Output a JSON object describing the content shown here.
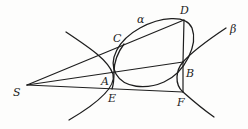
{
  "figure": {
    "type": "geometry-diagram",
    "curves": [
      {
        "id": "alpha",
        "label": "α",
        "kind": "ellipse"
      },
      {
        "id": "beta",
        "label": "β",
        "kind": "hyperbola"
      }
    ],
    "points": {
      "S": {
        "label": "S",
        "x": 27,
        "y": 85
      },
      "A": {
        "label": "A",
        "x": 114,
        "y": 71
      },
      "B": {
        "label": "B",
        "x": 183,
        "y": 62
      },
      "C": {
        "label": "C",
        "x": 123,
        "y": 44
      },
      "D": {
        "label": "D",
        "x": 184,
        "y": 20
      },
      "E": {
        "label": "E",
        "x": 112,
        "y": 89
      },
      "F": {
        "label": "F",
        "x": 183,
        "y": 92
      }
    },
    "segments": [
      [
        "S",
        "D"
      ],
      [
        "S",
        "B"
      ],
      [
        "S",
        "F"
      ],
      [
        "D",
        "B"
      ],
      [
        "B",
        "F"
      ]
    ],
    "labels": {
      "alpha": "α",
      "beta": "β",
      "S": "S",
      "A": "A",
      "B": "B",
      "C": "C",
      "D": "D",
      "E": "E",
      "F": "F"
    },
    "colors": {
      "ink": "#1e1e1e",
      "paper": "#fdfdfc"
    }
  }
}
